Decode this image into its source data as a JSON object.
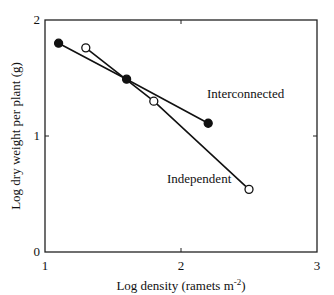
{
  "chart_data": {
    "type": "line",
    "title": "",
    "xlabel": "Log density (ramets m-2)",
    "xlabel_main": "Log density (ramets m",
    "xlabel_sup": "-2",
    "xlabel_end": ")",
    "ylabel": "Log dry weight per plant (g)",
    "xlim": [
      1,
      3
    ],
    "ylim": [
      0,
      2
    ],
    "x_ticks": [
      "1",
      "2",
      "3"
    ],
    "y_ticks": [
      "0",
      "1",
      "2"
    ],
    "grid": false,
    "legend": "inline labels",
    "series": [
      {
        "name": "Interconnected",
        "marker": "filled-circle",
        "x": [
          1.1,
          1.6,
          2.2
        ],
        "y": [
          1.8,
          1.49,
          1.11
        ]
      },
      {
        "name": "Independent",
        "marker": "open-circle",
        "x": [
          1.3,
          1.8,
          2.5
        ],
        "y": [
          1.76,
          1.3,
          0.54
        ]
      }
    ]
  }
}
